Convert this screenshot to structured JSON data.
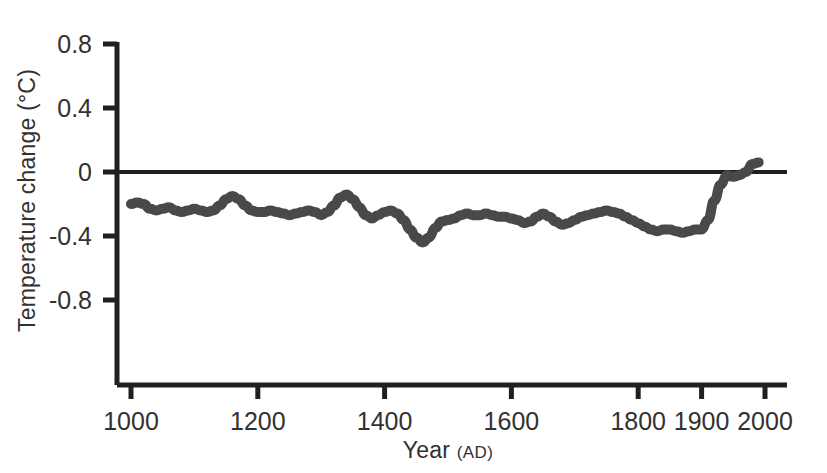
{
  "figure": {
    "background_color": "#ffffff",
    "axis_color": "#231f20",
    "series_color": "#4b4948"
  },
  "chart_data": {
    "type": "line",
    "title": "",
    "xlabel": "Year",
    "xlabel_suffix": "(AD)",
    "ylabel": "Temperature change (°C)",
    "xlim": [
      1000,
      2000
    ],
    "ylim": [
      -1.0,
      0.8
    ],
    "grid": false,
    "legend": null,
    "zero_reference_line": 0,
    "xticks": [
      1000,
      1200,
      1400,
      1600,
      1800,
      1900,
      2000
    ],
    "xtick_labels": [
      "1000",
      "1200",
      "1400",
      "1600",
      "1800",
      "1900",
      "2000"
    ],
    "yticks": [
      0.8,
      0.4,
      0,
      -0.4,
      -0.8
    ],
    "ytick_labels": [
      "0.8",
      "0.4",
      "0",
      "-0.4",
      "-0.8"
    ],
    "series": [
      {
        "name": "Northern Hemisphere temperature anomaly",
        "x": [
          1000,
          1010,
          1020,
          1030,
          1040,
          1050,
          1060,
          1070,
          1080,
          1090,
          1100,
          1110,
          1120,
          1130,
          1140,
          1150,
          1160,
          1170,
          1180,
          1190,
          1200,
          1210,
          1220,
          1230,
          1240,
          1250,
          1260,
          1270,
          1280,
          1290,
          1300,
          1310,
          1320,
          1330,
          1340,
          1350,
          1360,
          1370,
          1380,
          1390,
          1400,
          1410,
          1420,
          1430,
          1440,
          1450,
          1460,
          1470,
          1480,
          1490,
          1500,
          1510,
          1520,
          1530,
          1540,
          1550,
          1560,
          1570,
          1580,
          1590,
          1600,
          1610,
          1620,
          1630,
          1640,
          1650,
          1660,
          1670,
          1680,
          1690,
          1700,
          1710,
          1720,
          1730,
          1740,
          1750,
          1760,
          1770,
          1780,
          1790,
          1800,
          1810,
          1820,
          1830,
          1840,
          1850,
          1860,
          1870,
          1880,
          1890,
          1900,
          1910,
          1920,
          1930,
          1940,
          1950,
          1960,
          1970,
          1980,
          1990
        ],
        "y": [
          -0.2,
          -0.19,
          -0.2,
          -0.23,
          -0.24,
          -0.23,
          -0.22,
          -0.24,
          -0.25,
          -0.24,
          -0.23,
          -0.24,
          -0.25,
          -0.24,
          -0.21,
          -0.17,
          -0.15,
          -0.17,
          -0.21,
          -0.24,
          -0.25,
          -0.25,
          -0.24,
          -0.25,
          -0.26,
          -0.27,
          -0.26,
          -0.25,
          -0.24,
          -0.25,
          -0.27,
          -0.25,
          -0.21,
          -0.16,
          -0.14,
          -0.17,
          -0.22,
          -0.27,
          -0.29,
          -0.27,
          -0.25,
          -0.24,
          -0.26,
          -0.3,
          -0.36,
          -0.41,
          -0.44,
          -0.41,
          -0.35,
          -0.31,
          -0.3,
          -0.29,
          -0.27,
          -0.26,
          -0.27,
          -0.27,
          -0.26,
          -0.27,
          -0.28,
          -0.28,
          -0.29,
          -0.3,
          -0.32,
          -0.31,
          -0.28,
          -0.26,
          -0.28,
          -0.31,
          -0.33,
          -0.32,
          -0.3,
          -0.28,
          -0.27,
          -0.26,
          -0.25,
          -0.24,
          -0.25,
          -0.26,
          -0.28,
          -0.3,
          -0.32,
          -0.34,
          -0.36,
          -0.37,
          -0.36,
          -0.36,
          -0.37,
          -0.38,
          -0.37,
          -0.36,
          -0.36,
          -0.3,
          -0.18,
          -0.08,
          -0.02,
          -0.03,
          -0.02,
          0.0,
          0.05,
          0.06
        ]
      }
    ]
  },
  "axis_geometry": {
    "x_year_min": 1000,
    "x_year_max": 2000,
    "x_pixel_min": 131,
    "x_pixel_max": 765,
    "y_value_at_zero_pixel": 172,
    "pixels_per_half_degree": 64,
    "y_axis_pixel": 117,
    "x_axis_pixel": 385,
    "zero_line_pixel_right": 787
  }
}
